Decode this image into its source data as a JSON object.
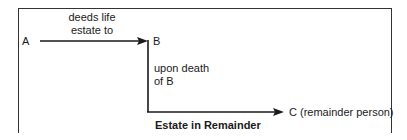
{
  "diagram": {
    "nodes": {
      "a": "A",
      "b": "B",
      "c": "C (remainder person)"
    },
    "edges": {
      "a_to_b_line1": "deeds life",
      "a_to_b_line2": "estate to",
      "b_to_c_line1": "upon death",
      "b_to_c_line2": "of B"
    },
    "caption": "Estate in Remainder",
    "colors": {
      "line": "#1a1a1a",
      "frame": "#333333"
    }
  }
}
